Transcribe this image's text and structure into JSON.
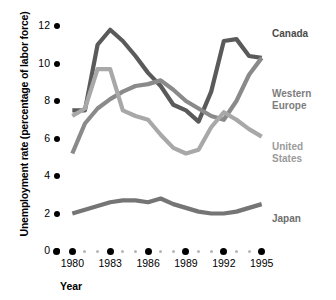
{
  "axes": {
    "y_title": "Unemployment rate (percentage of labor force)",
    "x_title": "Year",
    "y_ticks": [
      "12",
      "10",
      "8",
      "6",
      "4",
      "2",
      "0"
    ],
    "x_ticks": [
      "1980",
      "1983",
      "1986",
      "1989",
      "1992",
      "1995"
    ]
  },
  "labels": {
    "canada": "Canada",
    "western_europe": "Western\nEurope",
    "united_states": "United\nStates",
    "japan": "Japan"
  },
  "colors": {
    "canada": "#5a5a5a",
    "western_europe": "#8a8a8a",
    "united_states": "#a8a8a8",
    "japan": "#757575",
    "axis_dot": "#000000",
    "minor_dot": "#b5b5b5",
    "background": "#ffffff"
  },
  "chart_data": {
    "type": "line",
    "title": "",
    "xlabel": "Year",
    "ylabel": "Unemployment rate (percentage of labor force)",
    "xlim": [
      1979.5,
      1995.5
    ],
    "ylim": [
      0,
      12
    ],
    "grid": false,
    "legend_position": "inline-right-of-line-ends",
    "x": [
      1980,
      1981,
      1982,
      1983,
      1984,
      1985,
      1986,
      1987,
      1988,
      1989,
      1990,
      1991,
      1992,
      1993,
      1994,
      1995
    ],
    "series": [
      {
        "name": "Canada",
        "color": "#5a5a5a",
        "values": [
          7.5,
          7.5,
          11.0,
          11.8,
          11.2,
          10.4,
          9.5,
          8.8,
          7.8,
          7.5,
          6.9,
          8.5,
          11.2,
          11.3,
          10.4,
          10.3
        ]
      },
      {
        "name": "Western Europe",
        "color": "#8a8a8a",
        "values": [
          5.2,
          6.8,
          7.6,
          8.1,
          8.5,
          8.8,
          8.9,
          9.1,
          8.6,
          8.0,
          7.6,
          7.2,
          7.0,
          8.0,
          9.4,
          10.3
        ]
      },
      {
        "name": "United States",
        "color": "#a8a8a8",
        "values": [
          7.2,
          7.6,
          9.7,
          9.7,
          7.5,
          7.2,
          7.0,
          6.2,
          5.5,
          5.2,
          5.4,
          6.6,
          7.4,
          7.0,
          6.5,
          6.1
        ]
      },
      {
        "name": "Japan",
        "color": "#757575",
        "values": [
          2.0,
          2.2,
          2.4,
          2.6,
          2.7,
          2.7,
          2.6,
          2.8,
          2.5,
          2.3,
          2.1,
          2.0,
          2.0,
          2.1,
          2.3,
          2.5
        ]
      }
    ]
  }
}
